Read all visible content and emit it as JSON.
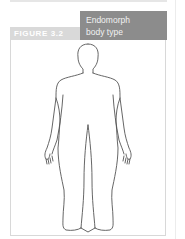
{
  "figure": {
    "label": "FIGURE 3.2",
    "title_line1": "Endomorph",
    "title_line2": "body type",
    "colors": {
      "label_bg": "#d9d9d9",
      "title_bg": "#8c8c8c",
      "outline": "#555555"
    },
    "illustration": "endomorph-body-outline"
  }
}
